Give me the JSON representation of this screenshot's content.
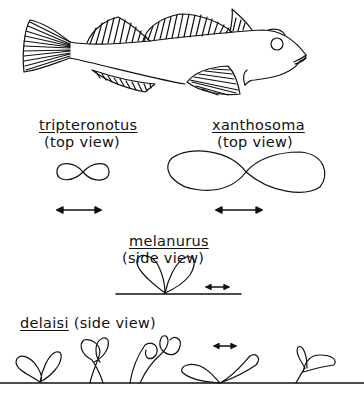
{
  "figure": {
    "panels": [
      {
        "species": "tripteronotus",
        "view": "(top view)",
        "pattern": "small figure-eight"
      },
      {
        "species": "xanthosoma",
        "view": "(top view)",
        "pattern": "large figure-eight"
      },
      {
        "species": "melanurus",
        "view": "(side view)",
        "pattern": "two-petal loops on baseline"
      },
      {
        "species": "delaisi",
        "view": "(side view)",
        "pattern": "series of loop variants on ground line"
      }
    ],
    "scale_arrow": "double-headed-arrow",
    "line_color": "#111111",
    "background": "#ffffff"
  }
}
